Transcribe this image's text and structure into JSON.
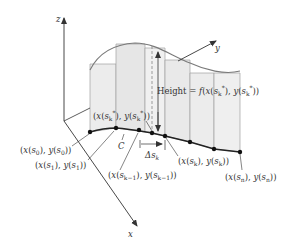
{
  "figure": {
    "axes": {
      "z_label": "z",
      "y_label": "y",
      "x_label": "x"
    },
    "curve_label": "C",
    "height_label": {
      "prefix": "Height = ",
      "func": "f",
      "text": "Height = f(x(s*k), y(s*k))"
    },
    "delta_label": {
      "symbol": "Δs",
      "sub": "k"
    },
    "point_labels": {
      "sk_star": "(x(s*k), y(s*k))",
      "s0": "(x(s0), y(s0))",
      "s1": "(x(s1), y(s1))",
      "sk_minus_1": "(x(sk−1), y(sk−1))",
      "sk": "(x(sk), y(sk))",
      "sn": "(x(sn), y(sn))"
    },
    "colors": {
      "ink": "#333333",
      "panel_fill": "#ececec",
      "panel_stroke": "#9a9a9a",
      "top_curve": "#7a7a7a",
      "base_curve": "#222222"
    }
  }
}
